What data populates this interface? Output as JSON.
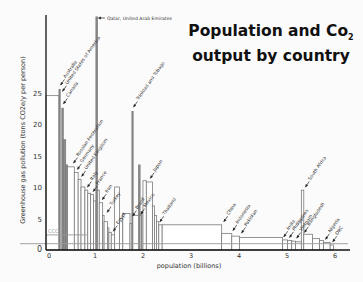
{
  "chart_data": {
    "type": "bar",
    "subtype": "variable-width bar (width = population, height = per-capita emissions)",
    "title_line1": "Population and Co",
    "title_sub": "2",
    "title_line2": "output by country",
    "xlabel": "population (billions)",
    "ylabel": "Greenhouse gas pollution (tons CO2e/y per person)",
    "xlim": [
      0,
      6.3
    ],
    "ylim": [
      0,
      28
    ],
    "x_ticks": [
      "0",
      "1",
      "2",
      "3",
      "4",
      "5",
      "6"
    ],
    "y_ticks": [
      "0",
      "5",
      "10",
      "15",
      "20",
      "25"
    ],
    "reference_lines": [
      {
        "label": "CCC",
        "y": 2.4,
        "x_end": 0.85
      },
      {
        "label": "",
        "y": 1.0
      }
    ],
    "bars": [
      {
        "name": "",
        "x0": 0.0,
        "w": 0.27,
        "y": 24.5
      },
      {
        "name": "Australia",
        "x0": 0.27,
        "w": 0.02,
        "y": 25.5
      },
      {
        "name": "United States of America",
        "x0": 0.29,
        "w": 0.3,
        "y": 24.5,
        "hidden": true
      },
      {
        "name": "Canada",
        "x0": 0.33,
        "w": 0.03,
        "y": 22.5
      },
      {
        "name": "",
        "x0": 0.36,
        "w": 0.05,
        "y": 17.5
      },
      {
        "name": "",
        "x0": 0.41,
        "w": 0.04,
        "y": 13.5
      },
      {
        "name": "Russian Federation",
        "x0": 0.45,
        "w": 0.14,
        "y": 13.2
      },
      {
        "name": "Germany",
        "x0": 0.59,
        "w": 0.08,
        "y": 12.3
      },
      {
        "name": "United Kingdom",
        "x0": 0.67,
        "w": 0.06,
        "y": 11.2
      },
      {
        "name": "",
        "x0": 0.73,
        "w": 0.08,
        "y": 10.0
      },
      {
        "name": "Italy",
        "x0": 0.81,
        "w": 0.06,
        "y": 9.5
      },
      {
        "name": "",
        "x0": 0.87,
        "w": 0.06,
        "y": 9.0
      },
      {
        "name": "France",
        "x0": 0.93,
        "w": 0.06,
        "y": 8.8
      },
      {
        "name": "",
        "x0": 0.99,
        "w": 0.05,
        "y": 7.8
      },
      {
        "name": "Qatar, United Arab Emirates",
        "x0": 1.04,
        "w": 0.03,
        "y": 37.0
      },
      {
        "name": "",
        "x0": 1.07,
        "w": 0.04,
        "y": 9.5
      },
      {
        "name": "Iran",
        "x0": 1.11,
        "w": 0.07,
        "y": 7.5
      },
      {
        "name": "",
        "x0": 1.18,
        "w": 0.03,
        "y": 5.5
      },
      {
        "name": "Turkey",
        "x0": 1.21,
        "w": 0.07,
        "y": 4.5
      },
      {
        "name": "",
        "x0": 1.28,
        "w": 0.03,
        "y": 3.5
      },
      {
        "name": "",
        "x0": 1.31,
        "w": 0.05,
        "y": 2.8
      },
      {
        "name": "",
        "x0": 1.36,
        "w": 0.07,
        "y": 2.4
      },
      {
        "name": "",
        "x0": 1.43,
        "w": 0.1,
        "y": 10.0
      },
      {
        "name": "Egypt",
        "x0": 1.53,
        "w": 0.07,
        "y": 5.0
      },
      {
        "name": "",
        "x0": 1.6,
        "w": 0.15,
        "y": 5.8
      },
      {
        "name": "",
        "x0": 1.75,
        "w": 0.04,
        "y": 4.2
      },
      {
        "name": "Trinidad and Tobago",
        "x0": 1.79,
        "w": 0.02,
        "y": 22.0
      },
      {
        "name": "Brazil",
        "x0": 1.81,
        "w": 0.18,
        "y": 5.5
      },
      {
        "name": "",
        "x0": 1.93,
        "w": 0.03,
        "y": 13.5
      },
      {
        "name": "Mexico",
        "x0": 1.99,
        "w": 0.03,
        "y": 6.0
      },
      {
        "name": "",
        "x0": 2.02,
        "w": 0.07,
        "y": 11.0
      },
      {
        "name": "Japan",
        "x0": 2.09,
        "w": 0.13,
        "y": 10.8
      },
      {
        "name": "",
        "x0": 2.22,
        "w": 0.04,
        "y": 7.0
      },
      {
        "name": "",
        "x0": 2.26,
        "w": 0.04,
        "y": 5.5
      },
      {
        "name": "",
        "x0": 2.3,
        "w": 0.05,
        "y": 4.5
      },
      {
        "name": "Thailand",
        "x0": 2.35,
        "w": 0.07,
        "y": 4.0
      },
      {
        "name": "",
        "x0": 2.42,
        "w": 1.24,
        "y": 4.0
      },
      {
        "name": "China",
        "x0": 2.42,
        "w": 1.24,
        "y": 4.0,
        "hidden": true
      },
      {
        "name": "Indonesia",
        "x0": 3.66,
        "w": 0.21,
        "y": 2.6
      },
      {
        "name": "Pakistan",
        "x0": 3.87,
        "w": 0.16,
        "y": 2.2
      },
      {
        "name": "",
        "x0": 4.03,
        "w": 0.9,
        "y": 2.0
      },
      {
        "name": "India",
        "x0": 4.93,
        "w": 0.1,
        "y": 1.6
      },
      {
        "name": "Philippines",
        "x0": 5.03,
        "w": 0.09,
        "y": 1.5
      },
      {
        "name": "Vietnam",
        "x0": 5.12,
        "w": 0.08,
        "y": 1.4
      },
      {
        "name": "",
        "x0": 5.2,
        "w": 0.12,
        "y": 1.3
      },
      {
        "name": "South Africa",
        "x0": 5.32,
        "w": 0.05,
        "y": 9.5
      },
      {
        "name": "",
        "x0": 5.37,
        "w": 0.18,
        "y": 2.5
      },
      {
        "name": "Bangladesh",
        "x0": 5.55,
        "w": 0.15,
        "y": 1.8
      },
      {
        "name": "",
        "x0": 5.7,
        "w": 0.08,
        "y": 1.5
      },
      {
        "name": "Nigeria",
        "x0": 5.78,
        "w": 0.14,
        "y": 1.2
      },
      {
        "name": "DRC",
        "x0": 5.92,
        "w": 0.07,
        "y": 0.8
      }
    ],
    "annotations": [
      {
        "text": "Qatar, United Arab Emirates",
        "x": 1.06,
        "y": 37.0,
        "rot": 0
      },
      {
        "text": "Australia",
        "x": 0.28,
        "y": 26.0,
        "rot": -55
      },
      {
        "text": "United States of America",
        "x": 0.32,
        "y": 25.0,
        "rot": -55
      },
      {
        "text": "Canada",
        "x": 0.34,
        "y": 23.0,
        "rot": -55
      },
      {
        "text": "Trinidad and Tobago",
        "x": 1.8,
        "y": 22.5,
        "rot": -55
      },
      {
        "text": "Russian Federation",
        "x": 0.55,
        "y": 13.6,
        "rot": -55
      },
      {
        "text": "Germany",
        "x": 0.63,
        "y": 12.6,
        "rot": -55
      },
      {
        "text": "United Kingdom",
        "x": 0.72,
        "y": 11.5,
        "rot": -55
      },
      {
        "text": "Italy",
        "x": 0.84,
        "y": 9.8,
        "rot": -55
      },
      {
        "text": "France",
        "x": 0.96,
        "y": 9.1,
        "rot": -55
      },
      {
        "text": "Iran",
        "x": 1.15,
        "y": 7.8,
        "rot": -55
      },
      {
        "text": "Turkey",
        "x": 1.25,
        "y": 5.8,
        "rot": -55
      },
      {
        "text": "Egypt",
        "x": 1.38,
        "y": 2.8,
        "rot": -55
      },
      {
        "text": "Brazil",
        "x": 1.78,
        "y": 5.2,
        "rot": -55
      },
      {
        "text": "Mexico",
        "x": 1.95,
        "y": 5.5,
        "rot": -55
      },
      {
        "text": "Japan",
        "x": 2.15,
        "y": 11.2,
        "rot": -55
      },
      {
        "text": "Thailand",
        "x": 2.35,
        "y": 4.3,
        "rot": -55
      },
      {
        "text": "China",
        "x": 3.68,
        "y": 4.3,
        "rot": -55
      },
      {
        "text": "Indonesia",
        "x": 3.87,
        "y": 2.9,
        "rot": -55
      },
      {
        "text": "Pakistan",
        "x": 4.05,
        "y": 2.5,
        "rot": -55
      },
      {
        "text": "India",
        "x": 4.93,
        "y": 1.9,
        "rot": -55
      },
      {
        "text": "Philippines",
        "x": 5.05,
        "y": 1.8,
        "rot": -55
      },
      {
        "text": "Vietnam",
        "x": 5.2,
        "y": 1.7,
        "rot": -55
      },
      {
        "text": "South Africa",
        "x": 5.38,
        "y": 9.8,
        "rot": -55
      },
      {
        "text": "Bangladesh",
        "x": 5.36,
        "y": 2.6,
        "rot": -55
      },
      {
        "text": "Nigeria",
        "x": 5.8,
        "y": 1.5,
        "rot": -55
      },
      {
        "text": "DRC",
        "x": 5.95,
        "y": 1.1,
        "rot": -55
      }
    ],
    "grid": false,
    "legend": "none"
  },
  "colors": {
    "background": "#fbfbfb",
    "bar_stroke": "#7a7a7a",
    "bar_fill": "#ffffff",
    "dark_bar_fill": "#8c8c8c",
    "axis": "#111111",
    "text": "#333333"
  },
  "top_cut_text": "ecca centreaticme"
}
